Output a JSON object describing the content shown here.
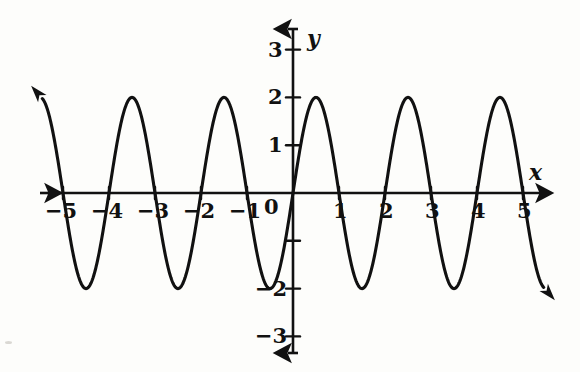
{
  "figure": {
    "background_color": "#fdfdfb",
    "ink_color": "#111111",
    "axis_labels": {
      "x": "x",
      "y": "y"
    },
    "origin_label": "0"
  },
  "chart_data": {
    "type": "line",
    "title": "",
    "subtitle": "",
    "xlabel": "x",
    "ylabel": "y",
    "xlim": [
      -5.45,
      5.45
    ],
    "ylim": [
      -3.6,
      3.6
    ],
    "grid": false,
    "legend": null,
    "annotations": [],
    "function": "y = 2 sin(pi x)",
    "amplitude": 2,
    "period": 2,
    "midline": 0,
    "phase_shift": 0,
    "zeros": [
      -5,
      -4,
      -3,
      -2,
      -1,
      0,
      1,
      2,
      3,
      4,
      5
    ],
    "maxima_x": [
      -4.5,
      -2.5,
      -0.5,
      0.5,
      2.5,
      4.5
    ],
    "maxima_y": 2,
    "minima_x": [
      -3.5,
      -1.5,
      1.5,
      3.5
    ],
    "minima_y": -2,
    "x_ticks": [
      -5,
      -4,
      -3,
      -2,
      -1,
      1,
      2,
      3,
      4,
      5
    ],
    "x_tick_labels": [
      "−5",
      "−4",
      "−3",
      "−2",
      "−1",
      "1",
      "2",
      "3",
      "4",
      "5"
    ],
    "y_ticks": [
      -3,
      -2,
      -1,
      1,
      2,
      3
    ],
    "y_tick_labels": [
      "−3",
      "−2",
      "",
      "",
      "2",
      "3"
    ],
    "y_labeled_ticks": [
      {
        "value": 3,
        "label": "3"
      },
      {
        "value": 2,
        "label": "2"
      },
      {
        "value": 1,
        "label": "1"
      },
      {
        "value": -2,
        "label": "−2"
      },
      {
        "value": -3,
        "label": "−3"
      }
    ],
    "series": [
      {
        "name": "y = 2 sin(pi x)",
        "color": "#111111",
        "x": [
          -5.45,
          -5.3,
          -5.15,
          -5.0,
          -4.85,
          -4.7,
          -4.5,
          -4.3,
          -4.15,
          -4.0,
          -3.85,
          -3.7,
          -3.5,
          -3.3,
          -3.15,
          -3.0,
          -2.85,
          -2.7,
          -2.5,
          -2.3,
          -2.15,
          -2.0,
          -1.85,
          -1.7,
          -1.5,
          -1.3,
          -1.15,
          -1.0,
          -0.85,
          -0.7,
          -0.5,
          -0.3,
          -0.15,
          0.0,
          0.15,
          0.3,
          0.5,
          0.7,
          0.85,
          1.0,
          1.15,
          1.3,
          1.5,
          1.7,
          1.85,
          2.0,
          2.15,
          2.3,
          2.5,
          2.7,
          2.85,
          3.0,
          3.15,
          3.3,
          3.5,
          3.7,
          3.85,
          4.0,
          4.15,
          4.3,
          4.5,
          4.7,
          4.85,
          5.0,
          5.15,
          5.3,
          5.45
        ],
        "y": [
          2.72,
          1.81,
          0.93,
          0.0,
          -0.93,
          -1.62,
          -2.0,
          -1.62,
          -0.93,
          0.0,
          0.93,
          1.62,
          2.0,
          1.62,
          0.93,
          0.0,
          -0.93,
          -1.62,
          -2.0,
          -1.62,
          -0.93,
          0.0,
          0.93,
          1.62,
          2.0,
          1.62,
          0.93,
          0.0,
          -0.93,
          -1.62,
          -2.0,
          -1.62,
          -0.93,
          0.0,
          0.93,
          1.62,
          2.0,
          1.62,
          0.93,
          0.0,
          -0.93,
          -1.62,
          -2.0,
          -1.62,
          -0.93,
          0.0,
          0.93,
          1.62,
          2.0,
          1.62,
          0.93,
          0.0,
          -0.93,
          -1.62,
          -2.0,
          -1.62,
          -0.93,
          0.0,
          0.93,
          1.62,
          2.0,
          1.62,
          0.93,
          0.0,
          -0.93,
          -1.81,
          -2.72
        ]
      }
    ]
  }
}
